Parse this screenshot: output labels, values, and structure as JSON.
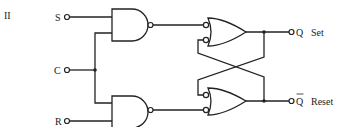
{
  "figure": {
    "label": "II"
  },
  "inputs": {
    "s": "S",
    "c": "C",
    "r": "R"
  },
  "outputs": {
    "q": {
      "symbol": "Q",
      "name": "Set"
    },
    "qbar": {
      "symbol": "Q",
      "overbar": true,
      "name": "Reset"
    }
  },
  "components": {
    "nand_top": "NAND gate (S, C)",
    "nand_bottom": "NAND gate (C, R)",
    "or_top": "OR gate with inverted inputs (set latch)",
    "or_bottom": "OR gate with inverted inputs (reset latch)"
  },
  "colors": {
    "ink": "#222222",
    "background": "#ffffff"
  }
}
